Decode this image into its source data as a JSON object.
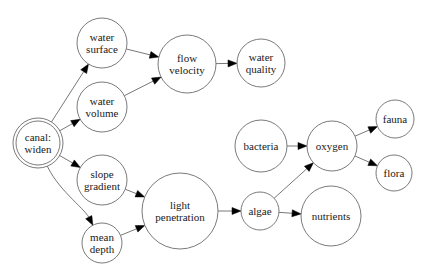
{
  "diagram": {
    "type": "directed-graph",
    "nodes": [
      {
        "id": "canal_widen",
        "lines": [
          "canal:",
          "widen"
        ],
        "cx": 38,
        "cy": 143,
        "r": 22,
        "double": true
      },
      {
        "id": "water_surface",
        "lines": [
          "water",
          "surface"
        ],
        "cx": 102,
        "cy": 43,
        "r": 25
      },
      {
        "id": "water_volume",
        "lines": [
          "water",
          "volume"
        ],
        "cx": 102,
        "cy": 107,
        "r": 25
      },
      {
        "id": "slope_gradient",
        "lines": [
          "slope",
          "gradient"
        ],
        "cx": 102,
        "cy": 180,
        "r": 25
      },
      {
        "id": "mean_depth",
        "lines": [
          "mean",
          "depth"
        ],
        "cx": 102,
        "cy": 243,
        "r": 20
      },
      {
        "id": "flow_velocity",
        "lines": [
          "flow",
          "velocity"
        ],
        "cx": 187,
        "cy": 64,
        "r": 29
      },
      {
        "id": "water_quality",
        "lines": [
          "water",
          "quality"
        ],
        "cx": 261,
        "cy": 63,
        "r": 24
      },
      {
        "id": "light_penetration",
        "lines": [
          "light",
          "penetration"
        ],
        "cx": 180,
        "cy": 211,
        "r": 38
      },
      {
        "id": "algae",
        "lines": [
          "algae"
        ],
        "cx": 260,
        "cy": 211,
        "r": 19
      },
      {
        "id": "bacteria",
        "lines": [
          "bacteria"
        ],
        "cx": 261,
        "cy": 146,
        "r": 26
      },
      {
        "id": "oxygen",
        "lines": [
          "oxygen"
        ],
        "cx": 332,
        "cy": 146,
        "r": 25
      },
      {
        "id": "nutrients",
        "lines": [
          "nutrients"
        ],
        "cx": 331,
        "cy": 216,
        "r": 30
      },
      {
        "id": "fauna",
        "lines": [
          "fauna"
        ],
        "cx": 395,
        "cy": 119,
        "r": 19
      },
      {
        "id": "flora",
        "lines": [
          "flora"
        ],
        "cx": 394,
        "cy": 173,
        "r": 18
      }
    ],
    "edges": [
      {
        "from": "canal_widen",
        "to": "water_surface"
      },
      {
        "from": "canal_widen",
        "to": "water_volume"
      },
      {
        "from": "canal_widen",
        "to": "slope_gradient"
      },
      {
        "from": "canal_widen",
        "to": "mean_depth",
        "curve": true
      },
      {
        "from": "water_surface",
        "to": "flow_velocity"
      },
      {
        "from": "water_volume",
        "to": "flow_velocity"
      },
      {
        "from": "flow_velocity",
        "to": "water_quality"
      },
      {
        "from": "slope_gradient",
        "to": "light_penetration"
      },
      {
        "from": "mean_depth",
        "to": "light_penetration"
      },
      {
        "from": "light_penetration",
        "to": "algae"
      },
      {
        "from": "algae",
        "to": "oxygen"
      },
      {
        "from": "algae",
        "to": "nutrients"
      },
      {
        "from": "bacteria",
        "to": "oxygen"
      },
      {
        "from": "oxygen",
        "to": "fauna"
      },
      {
        "from": "oxygen",
        "to": "flora"
      }
    ]
  }
}
